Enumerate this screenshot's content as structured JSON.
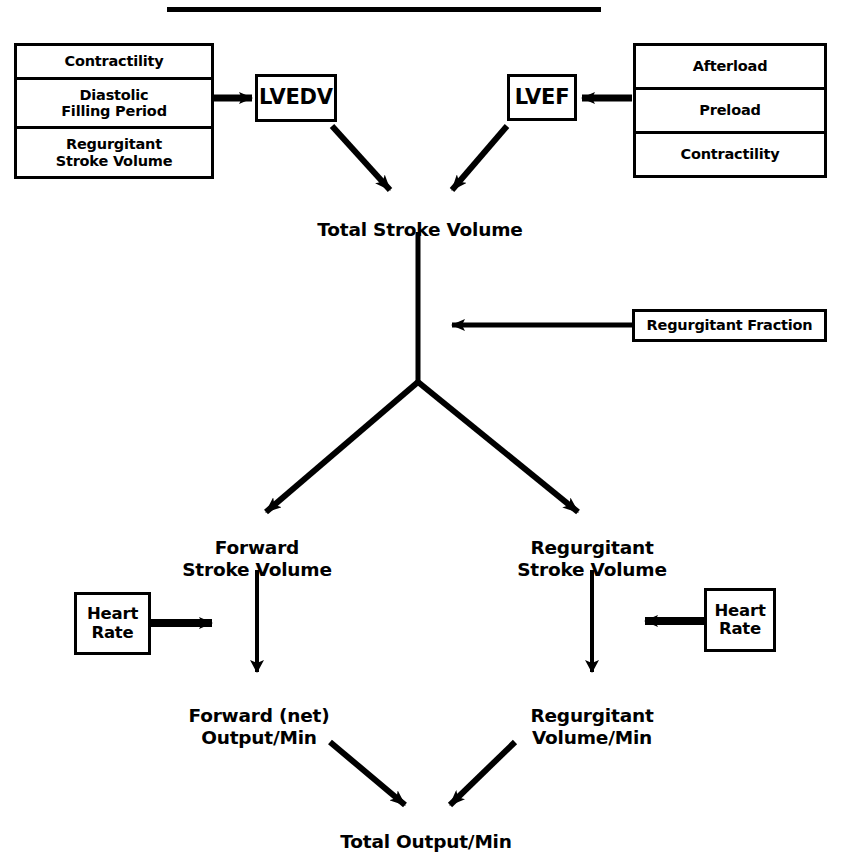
{
  "diagram": {
    "title_rule": "horizontal-rule",
    "ink_color": "#000000",
    "background_color": "#ffffff",
    "left_determinants_box": {
      "name": "LVEDV determinants",
      "rows": [
        "Contractility",
        "Diastolic\nFilling Period",
        "Regurgitant\nStroke Volume"
      ]
    },
    "right_determinants_box": {
      "name": "LVEF determinants",
      "rows": [
        "Afterload",
        "Preload",
        "Contractility"
      ]
    },
    "nodes": {
      "lvedv": "LVEDV",
      "lvef": "LVEF",
      "total_stroke_volume": "Total Stroke Volume",
      "regurgitant_fraction": "Regurgitant Fraction",
      "forward_stroke_volume": "Forward\nStroke Volume",
      "regurgitant_stroke_volume": "Regurgitant\nStroke Volume",
      "heart_rate_left": "Heart\nRate",
      "heart_rate_right": "Heart\nRate",
      "forward_output_min": "Forward (net)\nOutput/Min",
      "regurgitant_volume_min": "Regurgitant\nVolume/Min",
      "total_output_min": "Total Output/Min"
    },
    "edges": [
      {
        "id": "edge-left-determinants-to-lvedv",
        "from": "left_determinants_box",
        "to": "lvedv",
        "style": "arrow-right"
      },
      {
        "id": "edge-right-determinants-to-lvef",
        "from": "right_determinants_box",
        "to": "lvef",
        "style": "arrow-left"
      },
      {
        "id": "edge-lvedv-to-total-stroke-volume",
        "from": "lvedv",
        "to": "total_stroke_volume",
        "style": "arrow-diagonal-down-right"
      },
      {
        "id": "edge-lvef-to-total-stroke-volume",
        "from": "lvef",
        "to": "total_stroke_volume",
        "style": "arrow-diagonal-down-left"
      },
      {
        "id": "edge-total-stroke-volume-to-split",
        "from": "total_stroke_volume",
        "to": "split_point",
        "style": "line-vertical"
      },
      {
        "id": "edge-regurgitant-fraction-to-trunk",
        "from": "regurgitant_fraction",
        "to": "split_point",
        "style": "arrow-left"
      },
      {
        "id": "edge-split-to-forward-stroke-volume",
        "from": "split_point",
        "to": "forward_stroke_volume",
        "style": "arrow-diagonal-down-left"
      },
      {
        "id": "edge-split-to-regurgitant-stroke-volume",
        "from": "split_point",
        "to": "regurgitant_stroke_volume",
        "style": "arrow-diagonal-down-right"
      },
      {
        "id": "edge-forward-stroke-volume-to-output",
        "from": "forward_stroke_volume",
        "to": "forward_output_min",
        "style": "arrow-down"
      },
      {
        "id": "edge-regurgitant-stroke-volume-to-volume",
        "from": "regurgitant_stroke_volume",
        "to": "regurgitant_volume_min",
        "style": "arrow-down"
      },
      {
        "id": "edge-heart-rate-left-to-column",
        "from": "heart_rate_left",
        "to": "forward_column",
        "style": "arrow-right"
      },
      {
        "id": "edge-heart-rate-right-to-column",
        "from": "heart_rate_right",
        "to": "regurgitant_column",
        "style": "arrow-left"
      },
      {
        "id": "edge-forward-output-to-total",
        "from": "forward_output_min",
        "to": "total_output_min",
        "style": "arrow-diagonal-down-right"
      },
      {
        "id": "edge-regurgitant-volume-to-total",
        "from": "regurgitant_volume_min",
        "to": "total_output_min",
        "style": "arrow-diagonal-down-left"
      }
    ]
  }
}
